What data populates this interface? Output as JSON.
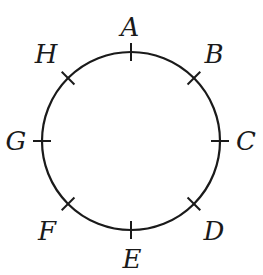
{
  "diagram": {
    "circle": {
      "cx": 131,
      "cy": 141,
      "r": 89,
      "stroke": "#1a1a1a"
    },
    "points": [
      {
        "label": "A",
        "angle": 90,
        "lx": 130,
        "ly": 36
      },
      {
        "label": "B",
        "angle": 45,
        "lx": 214,
        "ly": 63
      },
      {
        "label": "C",
        "angle": 0,
        "lx": 246,
        "ly": 150
      },
      {
        "label": "D",
        "angle": -45,
        "lx": 214,
        "ly": 240
      },
      {
        "label": "E",
        "angle": -90,
        "lx": 132,
        "ly": 268
      },
      {
        "label": "F",
        "angle": -135,
        "lx": 47,
        "ly": 240
      },
      {
        "label": "G",
        "angle": 180,
        "lx": 16,
        "ly": 150
      },
      {
        "label": "H",
        "angle": 135,
        "lx": 46,
        "ly": 63
      }
    ]
  }
}
